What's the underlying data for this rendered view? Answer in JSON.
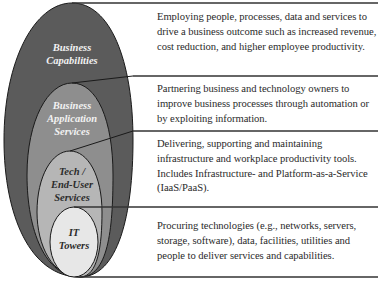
{
  "diagram": {
    "title": "",
    "colors": {
      "outer": "#5b5b5b",
      "application": "#8e8e8e",
      "tech": "#b6b6b6",
      "towers": "#e7e7e7",
      "stroke": "#1a1a1a",
      "rule": "#333333"
    },
    "layers": [
      {
        "id": "business-capabilities",
        "label_lines": [
          "Business",
          "Capabilities"
        ],
        "description": "Employing people, processes, data and services to drive a business outcome such as increased revenue, cost reduction, and higher employee productivity."
      },
      {
        "id": "business-application-services",
        "label_lines": [
          "Business",
          "Application",
          "Services"
        ],
        "description": "Partnering business and technology owners to improve business processes through automation or by exploiting information."
      },
      {
        "id": "tech-end-user-services",
        "label_lines": [
          "Tech /",
          "End-User",
          "Services"
        ],
        "description": "Delivering, supporting and maintaining infrastructure and workplace productivity tools. Includes Infrastructure- and Platform-as-a-Service (IaaS/PaaS)."
      },
      {
        "id": "it-towers",
        "label_lines": [
          "IT",
          "Towers"
        ],
        "description": "Procuring technologies (e.g., networks, servers, storage, software), data, facilities, utilities and people to deliver services and capabilities."
      }
    ]
  }
}
